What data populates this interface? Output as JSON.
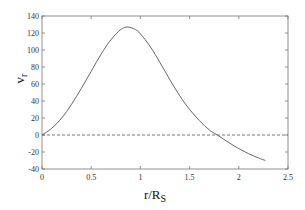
{
  "chart_data": {
    "type": "line",
    "title": "",
    "xlabel": "r/R",
    "xlabel_sub": "S",
    "ylabel": "v",
    "ylabel_sub": "r",
    "xlim": [
      0,
      2.5
    ],
    "ylim": [
      -40,
      140
    ],
    "xticks": [
      0,
      0.5,
      1,
      1.5,
      2,
      2.5
    ],
    "xtick_labels": [
      "0",
      "0.5",
      "1",
      "1.5",
      "2",
      "2.5"
    ],
    "yticks": [
      -40,
      -20,
      0,
      20,
      40,
      60,
      80,
      100,
      120,
      140
    ],
    "ytick_labels": [
      "-40",
      "-20",
      "0",
      "20",
      "40",
      "60",
      "80",
      "100",
      "120",
      "140"
    ],
    "grid": false,
    "legend": null,
    "series": [
      {
        "name": "v_r",
        "style": "solid",
        "color": "#555555",
        "x": [
          0,
          0.1,
          0.2,
          0.3,
          0.4,
          0.5,
          0.6,
          0.7,
          0.8,
          0.87,
          0.95,
          1.0,
          1.1,
          1.2,
          1.3,
          1.4,
          1.5,
          1.6,
          1.7,
          1.78,
          1.9,
          2.0,
          2.1,
          2.2,
          2.27
        ],
        "y": [
          0,
          8,
          20,
          36,
          55,
          75,
          95,
          112,
          124,
          127,
          124,
          119,
          104,
          85,
          65,
          46,
          30,
          17,
          6,
          0,
          -9,
          -16,
          -22,
          -27,
          -30
        ]
      },
      {
        "name": "zero",
        "style": "dashed",
        "color": "#555555",
        "x": [
          0,
          2.5
        ],
        "y": [
          0,
          0
        ]
      }
    ]
  }
}
